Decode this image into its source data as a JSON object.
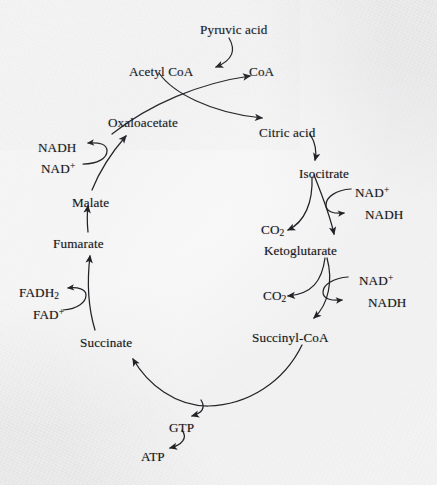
{
  "diagram": {
    "type": "cycle-flow-diagram",
    "background_color": "#ebebec",
    "ink_color": "#17171a",
    "nodes": [
      {
        "id": "pyruvic-acid",
        "label": "Pyruvic acid",
        "x": 200,
        "y": 23,
        "role": "input"
      },
      {
        "id": "acetyl-coa",
        "label": "Acetyl CoA",
        "x": 129,
        "y": 65,
        "role": "intermediate"
      },
      {
        "id": "coa",
        "label": "CoA",
        "x": 249,
        "y": 65,
        "role": "product"
      },
      {
        "id": "oxaloacetate",
        "label": "Oxaloacetate",
        "x": 108,
        "y": 116,
        "role": "cycle"
      },
      {
        "id": "nadh-malate",
        "label": "NADH",
        "x": 38,
        "y": 141,
        "role": "product"
      },
      {
        "id": "nad-malate",
        "label": "NAD",
        "sup": "+",
        "x": 41,
        "y": 162,
        "role": "reactant"
      },
      {
        "id": "malate",
        "label": "Malate",
        "x": 72,
        "y": 196,
        "role": "cycle"
      },
      {
        "id": "fumarate",
        "label": "Fumarate",
        "x": 53,
        "y": 237,
        "role": "cycle"
      },
      {
        "id": "fadh2",
        "label": "FADH",
        "sub": "2",
        "x": 19,
        "y": 286,
        "role": "product"
      },
      {
        "id": "fad",
        "label": "FAD",
        "sup": "+",
        "x": 33,
        "y": 308,
        "role": "reactant"
      },
      {
        "id": "succinate",
        "label": "Succinate",
        "x": 80,
        "y": 336,
        "role": "cycle"
      },
      {
        "id": "gtp",
        "label": "GTP",
        "x": 169,
        "y": 421,
        "role": "product"
      },
      {
        "id": "atp",
        "label": "ATP",
        "x": 141,
        "y": 450,
        "role": "product"
      },
      {
        "id": "succinyl-coa",
        "label": "Succinyl-CoA",
        "x": 252,
        "y": 331,
        "role": "cycle"
      },
      {
        "id": "co2-lower",
        "label": "CO",
        "sub": "2",
        "x": 263,
        "y": 289,
        "role": "product"
      },
      {
        "id": "nad-lower",
        "label": "NAD",
        "sup": "+",
        "x": 359,
        "y": 274,
        "role": "reactant"
      },
      {
        "id": "nadh-lower",
        "label": "NADH",
        "x": 368,
        "y": 296,
        "role": "product"
      },
      {
        "id": "ketoglutarate",
        "label": "Ketoglutarate",
        "x": 264,
        "y": 244,
        "role": "cycle"
      },
      {
        "id": "co2-upper",
        "label": "CO",
        "sub": "2",
        "x": 261,
        "y": 223,
        "role": "product"
      },
      {
        "id": "nad-upper",
        "label": "NAD",
        "sup": "+",
        "x": 355,
        "y": 186,
        "role": "reactant"
      },
      {
        "id": "nadh-upper",
        "label": "NADH",
        "x": 365,
        "y": 208,
        "role": "product"
      },
      {
        "id": "isocitrate",
        "label": "Isocitrate",
        "x": 299,
        "y": 167,
        "role": "cycle"
      },
      {
        "id": "citric-acid",
        "label": "Citric acid",
        "x": 259,
        "y": 126,
        "role": "cycle"
      }
    ],
    "edges": [
      {
        "id": "pyruvate-to-acetylcoa",
        "from": "pyruvic-acid",
        "to": "acetyl-coa",
        "style": "curved-arrow"
      },
      {
        "id": "acetylcoa-to-citrate",
        "from": "acetyl-coa",
        "to": "citric-acid",
        "style": "curved-arrow"
      },
      {
        "id": "oxaloacetate-to-coa",
        "from": "oxaloacetate",
        "to": "coa",
        "style": "curved-arrow"
      },
      {
        "id": "citrate-to-isocitrate",
        "from": "citric-acid",
        "to": "isocitrate",
        "style": "curved-arrow"
      },
      {
        "id": "isocitrate-to-ketoglutarate",
        "from": "isocitrate",
        "to": "ketoglutarate",
        "style": "curved-arrow"
      },
      {
        "id": "isocitrate-to-co2",
        "from": "isocitrate",
        "to": "co2-upper",
        "style": "branch-arrow"
      },
      {
        "id": "nad-to-nadh-upper",
        "from": "nad-upper",
        "to": "nadh-upper",
        "style": "cofactor-hook"
      },
      {
        "id": "ketoglutarate-to-succinylcoa",
        "from": "ketoglutarate",
        "to": "succinyl-coa",
        "style": "curved-arrow"
      },
      {
        "id": "ketoglutarate-to-co2",
        "from": "ketoglutarate",
        "to": "co2-lower",
        "style": "branch-arrow"
      },
      {
        "id": "nad-to-nadh-lower",
        "from": "nad-lower",
        "to": "nadh-lower",
        "style": "cofactor-hook"
      },
      {
        "id": "succinylcoa-to-succinate",
        "from": "succinyl-coa",
        "to": "succinate",
        "style": "curved-arrow"
      },
      {
        "id": "cycle-to-gtp",
        "from": "succinyl-coa",
        "to": "gtp",
        "style": "branch-arrow"
      },
      {
        "id": "gtp-to-atp",
        "from": "gtp",
        "to": "atp",
        "style": "curved-arrow"
      },
      {
        "id": "succinate-to-fumarate",
        "from": "succinate",
        "to": "fumarate",
        "style": "curved-arrow"
      },
      {
        "id": "fad-to-fadh2",
        "from": "fad",
        "to": "fadh2",
        "style": "cofactor-hook"
      },
      {
        "id": "fumarate-to-malate",
        "from": "fumarate",
        "to": "malate",
        "style": "curved-arrow"
      },
      {
        "id": "malate-to-oxaloacetate",
        "from": "malate",
        "to": "oxaloacetate",
        "style": "curved-arrow"
      },
      {
        "id": "nad-to-nadh-malate",
        "from": "nad-malate",
        "to": "nadh-malate",
        "style": "cofactor-hook"
      }
    ]
  }
}
